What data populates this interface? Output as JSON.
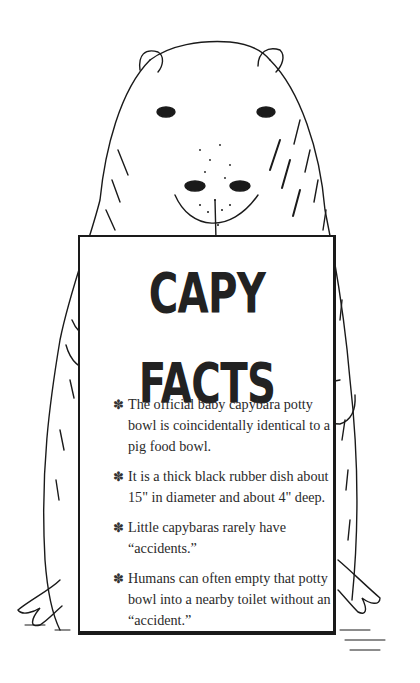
{
  "sign": {
    "title": "CAPY FACTS",
    "facts": [
      {
        "bullet": "✽",
        "text": "The official baby capybara potty bowl is coincidentally identical to a pig food bowl."
      },
      {
        "bullet": "✽",
        "text": "It is a thick black rubber dish about 15\" in diameter and about 4\" deep."
      },
      {
        "bullet": "✽",
        "text": "Little capybaras rarely have “accidents.”"
      },
      {
        "bullet": "✽",
        "text": "Humans can often empty that potty bowl into a nearby toilet without an “accident.”"
      }
    ]
  },
  "illustration": {
    "subject": "capybara-holding-sign",
    "style": "black ink line drawing",
    "ink_color": "#1a1a1a",
    "background_color": "#ffffff"
  }
}
